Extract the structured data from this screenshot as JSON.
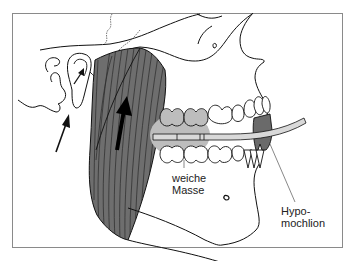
{
  "figure": {
    "colors": {
      "frame": "#8a8a8a",
      "line": "#111111",
      "muscle": "#6e6e6e",
      "muscle_striation": "#2a2a2a",
      "soft_mass": "#bdbdbd",
      "hypomochlion": "#6a6a6a",
      "splint": "#d9d9d9"
    },
    "labels": {
      "soft_mass": {
        "line1": "weiche",
        "line2": "Masse"
      },
      "hypomochlion": {
        "line1": "Hypo-",
        "line2": "mochlion"
      }
    },
    "arrows": [
      {
        "name": "joint-arrow-small",
        "direction": "up-right"
      },
      {
        "name": "condyle-arrow",
        "direction": "up-right"
      },
      {
        "name": "muscle-force-arrow",
        "direction": "up"
      }
    ]
  }
}
